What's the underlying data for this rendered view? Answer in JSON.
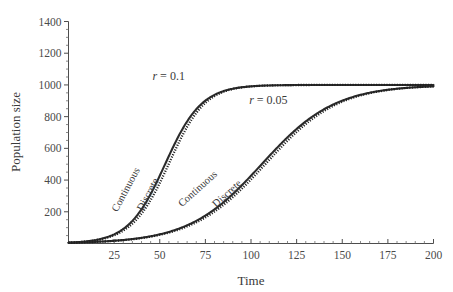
{
  "chart_data": {
    "type": "line",
    "title": "",
    "xlabel": "Time",
    "ylabel": "Population size",
    "xlim": [
      0,
      200
    ],
    "ylim": [
      0,
      1400
    ],
    "grid": false,
    "legend_position": "inline-curve-labels",
    "carrying_capacity": 1000,
    "initial_population": 5,
    "x_ticks": [
      25,
      50,
      75,
      100,
      125,
      150,
      175,
      200
    ],
    "x_tick_labels": [
      "25",
      "50",
      "75",
      "100",
      "125",
      "150",
      "175",
      "200"
    ],
    "x_minor_interval": 5,
    "y_ticks": [
      200,
      400,
      600,
      800,
      1000,
      1200,
      1400
    ],
    "y_tick_labels": [
      "200",
      "400",
      "600",
      "800",
      "1000",
      "1200",
      "1400"
    ],
    "y_minor_interval": 50,
    "annotations": [
      {
        "text_italic": "r",
        "text_rest": " = 0.1",
        "x": 46,
        "y": 1030,
        "name": "r-0-1-annotation"
      },
      {
        "text_italic": "r",
        "text_rest": " = 0.05",
        "x": 99,
        "y": 880,
        "name": "r-0-05-annotation"
      }
    ],
    "series": [
      {
        "name": "Continuous (r = 0.1)",
        "label": "Continuous",
        "style": "solid",
        "r": 0.1,
        "model": "continuous logistic",
        "x": [
          0,
          5,
          10,
          15,
          20,
          25,
          30,
          35,
          40,
          45,
          50,
          55,
          60,
          65,
          70,
          75,
          80,
          85,
          90,
          95,
          100,
          110,
          120,
          130,
          140,
          150,
          160,
          170,
          180,
          190,
          200
        ],
        "values": [
          5,
          8,
          13,
          22,
          36,
          58,
          93,
          147,
          228,
          339,
          477,
          624,
          755,
          850,
          913,
          950,
          971,
          983,
          990,
          994,
          996,
          999,
          1000,
          1000,
          1000,
          1000,
          1000,
          1000,
          1000,
          1000,
          1000
        ]
      },
      {
        "name": "Discrete (r = 0.1)",
        "label": "Discrete",
        "style": "dotted",
        "r": 0.1,
        "model": "discrete logistic",
        "x": [
          0,
          5,
          10,
          15,
          20,
          25,
          30,
          35,
          40,
          45,
          50,
          55,
          60,
          65,
          70,
          75,
          80,
          85,
          90,
          95,
          100,
          110,
          120,
          130,
          140,
          150,
          160,
          170,
          180,
          190,
          200
        ],
        "values": [
          5,
          8,
          12,
          20,
          32,
          51,
          81,
          128,
          199,
          299,
          429,
          576,
          713,
          820,
          893,
          939,
          965,
          980,
          988,
          993,
          996,
          999,
          1000,
          1000,
          1000,
          1000,
          1000,
          1000,
          1000,
          1000,
          1000
        ]
      },
      {
        "name": "Continuous (r = 0.05)",
        "label": "Continuous",
        "style": "solid",
        "r": 0.05,
        "model": "continuous logistic",
        "x": [
          0,
          10,
          20,
          30,
          40,
          50,
          60,
          70,
          80,
          90,
          100,
          110,
          120,
          130,
          140,
          150,
          160,
          170,
          180,
          190,
          200
        ],
        "values": [
          5,
          8,
          13,
          22,
          36,
          58,
          93,
          147,
          228,
          339,
          477,
          624,
          755,
          850,
          913,
          950,
          971,
          983,
          990,
          994,
          996
        ]
      },
      {
        "name": "Discrete (r = 0.05)",
        "label": "Discrete",
        "style": "dotted",
        "r": 0.05,
        "model": "discrete logistic",
        "x": [
          0,
          10,
          20,
          30,
          40,
          50,
          60,
          70,
          80,
          90,
          100,
          110,
          120,
          130,
          140,
          150,
          160,
          170,
          180,
          190,
          200
        ],
        "values": [
          5,
          8,
          12,
          21,
          34,
          55,
          88,
          140,
          218,
          327,
          463,
          611,
          745,
          843,
          909,
          948,
          970,
          983,
          990,
          994,
          996
        ]
      }
    ],
    "curve_labels": [
      {
        "text": "Continuous",
        "x": 33,
        "y": 330,
        "rotation": -62,
        "name": "curve-label-continuous-fast"
      },
      {
        "text": "Discrete",
        "x": 45,
        "y": 300,
        "rotation": -62,
        "name": "curve-label-discrete-fast"
      },
      {
        "text": "Continuous",
        "x": 72,
        "y": 330,
        "rotation": -42,
        "name": "curve-label-continuous-slow"
      },
      {
        "text": "Discrete",
        "x": 88,
        "y": 300,
        "rotation": -42,
        "name": "curve-label-discrete-slow"
      }
    ],
    "colors": {
      "curve": "#2b2b2b",
      "axis": "#4d4d4d",
      "text": "#3a3a3a",
      "background": "#ffffff"
    }
  }
}
